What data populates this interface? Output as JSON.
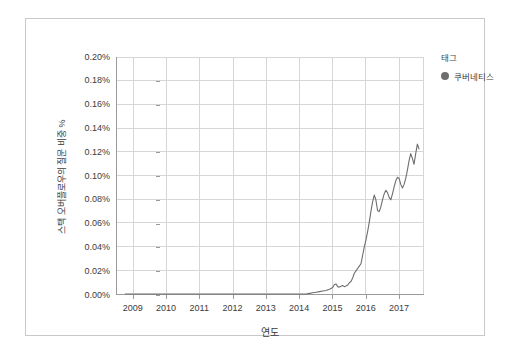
{
  "chart_data": {
    "type": "line",
    "title": "",
    "xlabel": "연도",
    "ylabel": "스택 오버플로우의 질문 비중 %",
    "xlim": [
      2008.5,
      2017.75
    ],
    "ylim": [
      0.0,
      0.2
    ],
    "grid": true,
    "legend_position": "right",
    "legend_title": "태그",
    "series": [
      {
        "name": "쿠버네티스",
        "color": "#6e6e6e",
        "x": [
          2008.75,
          2009.0,
          2009.25,
          2009.5,
          2009.75,
          2010.0,
          2010.25,
          2010.5,
          2010.75,
          2011.0,
          2011.25,
          2011.5,
          2011.75,
          2012.0,
          2012.25,
          2012.5,
          2012.75,
          2013.0,
          2013.25,
          2013.5,
          2013.75,
          2014.0,
          2014.1,
          2014.2,
          2014.3,
          2014.4,
          2014.5,
          2014.6,
          2014.7,
          2014.8,
          2014.9,
          2015.0,
          2015.05,
          2015.1,
          2015.15,
          2015.2,
          2015.25,
          2015.3,
          2015.35,
          2015.4,
          2015.45,
          2015.5,
          2015.55,
          2015.6,
          2015.65,
          2015.7,
          2015.75,
          2015.8,
          2015.85,
          2015.9,
          2015.95,
          2016.0,
          2016.05,
          2016.1,
          2016.15,
          2016.2,
          2016.25,
          2016.3,
          2016.35,
          2016.4,
          2016.45,
          2016.5,
          2016.55,
          2016.6,
          2016.65,
          2016.7,
          2016.75,
          2016.8,
          2016.85,
          2016.9,
          2016.95,
          2017.0,
          2017.05,
          2017.1,
          2017.15,
          2017.2,
          2017.25,
          2017.3,
          2017.35,
          2017.4,
          2017.45,
          2017.5,
          2017.55,
          2017.6
        ],
        "y": [
          0.0,
          0.0,
          0.0,
          0.0,
          0.0,
          0.0,
          0.0,
          0.0,
          0.0,
          0.0,
          0.0,
          0.0,
          0.0,
          0.0,
          0.0,
          0.0,
          0.0,
          0.0,
          0.0,
          0.0,
          0.0,
          0.0,
          0.0,
          0.0,
          0.0005,
          0.001,
          0.0015,
          0.002,
          0.0025,
          0.003,
          0.004,
          0.0055,
          0.008,
          0.0085,
          0.0062,
          0.0058,
          0.0065,
          0.0072,
          0.0062,
          0.0068,
          0.0075,
          0.0095,
          0.0105,
          0.0135,
          0.0175,
          0.0195,
          0.0215,
          0.0235,
          0.0255,
          0.0325,
          0.0395,
          0.0455,
          0.0525,
          0.0605,
          0.0695,
          0.0775,
          0.0835,
          0.0795,
          0.0705,
          0.0695,
          0.0735,
          0.0795,
          0.0845,
          0.0875,
          0.0855,
          0.0815,
          0.0795,
          0.0845,
          0.0905,
          0.0955,
          0.0985,
          0.0975,
          0.0925,
          0.0895,
          0.0925,
          0.0975,
          0.1045,
          0.1125,
          0.1185,
          0.1145,
          0.1095,
          0.1185,
          0.1265,
          0.1225
        ]
      }
    ],
    "y_ticks": [
      "0.00%",
      "0.02%",
      "0.04%",
      "0.06%",
      "0.08%",
      "0.10%",
      "0.12%",
      "0.14%",
      "0.16%",
      "0.18%",
      "0.20%"
    ],
    "y_tick_values": [
      0.0,
      0.02,
      0.04,
      0.06,
      0.08,
      0.1,
      0.12,
      0.14,
      0.16,
      0.18,
      0.2
    ],
    "x_ticks": [
      "2009",
      "2010",
      "2011",
      "2012",
      "2013",
      "2014",
      "2015",
      "2016",
      "2017"
    ],
    "x_tick_values": [
      2009,
      2010,
      2011,
      2012,
      2013,
      2014,
      2015,
      2016,
      2017
    ]
  }
}
